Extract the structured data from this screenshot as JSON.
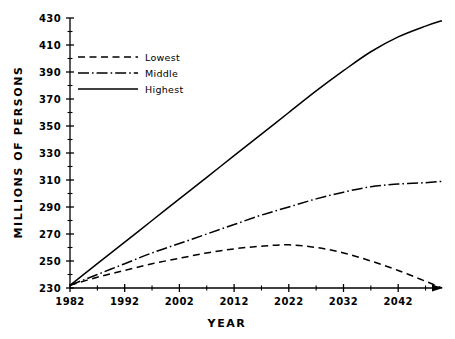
{
  "chart_data": {
    "type": "line",
    "title": "",
    "xlabel": "YEAR",
    "ylabel": "MILLIONS OF PERSONS",
    "xlim": [
      1982,
      2050
    ],
    "ylim": [
      230,
      430
    ],
    "grid": false,
    "legend_position": "upper-left",
    "x_ticks": [
      1982,
      1992,
      2002,
      2012,
      2022,
      2032,
      2042
    ],
    "x_tick_labels": [
      "1982",
      "1992",
      "2002",
      "2012",
      "2022",
      "2032",
      "2042"
    ],
    "x_minor_tick_interval": 5,
    "y_ticks": [
      230,
      250,
      270,
      290,
      310,
      330,
      350,
      370,
      390,
      410,
      430
    ],
    "y_tick_labels": [
      "230",
      "250",
      "270",
      "290",
      "310",
      "330",
      "350",
      "370",
      "390",
      "410",
      "430"
    ],
    "y_minor_tick_interval": 10,
    "x": [
      1982,
      1987,
      1992,
      1997,
      2002,
      2007,
      2012,
      2017,
      2022,
      2027,
      2032,
      2037,
      2042,
      2047,
      2050
    ],
    "series": [
      {
        "name": "Lowest",
        "style": "dashed",
        "values": [
          232,
          238,
          243,
          248,
          252,
          256,
          259,
          261,
          262,
          260,
          256,
          250,
          243,
          235,
          230
        ]
      },
      {
        "name": "Middle",
        "style": "dash-dot",
        "values": [
          232,
          240,
          248,
          256,
          263,
          270,
          277,
          284,
          290,
          296,
          301,
          305,
          307,
          308,
          309
        ]
      },
      {
        "name": "Highest",
        "style": "solid",
        "values": [
          232,
          248,
          264,
          280,
          296,
          312,
          328,
          344,
          360,
          376,
          391,
          405,
          416,
          424,
          428
        ]
      }
    ]
  },
  "legend": {
    "entries": [
      {
        "label": "Lowest",
        "style": "dashed"
      },
      {
        "label": "Middle",
        "style": "dash-dot"
      },
      {
        "label": "Highest",
        "style": "solid"
      }
    ]
  },
  "axes": {
    "x_title": "YEAR",
    "y_title": "MILLIONS OF PERSONS"
  },
  "colors": {
    "line": "#000000",
    "axis": "#000000",
    "background": "#ffffff"
  }
}
